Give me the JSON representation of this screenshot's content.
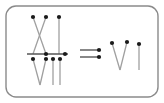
{
  "figure": {
    "kind": "string-diagram-equation",
    "canvas": {
      "width": 164,
      "height": 103,
      "background": "#ffffff"
    },
    "colors": {
      "frame_stroke": "#8a8a8a",
      "edge_stroke": "#a0a0a0",
      "node_fill": "#1a1a1a",
      "bar_stroke": "#555555",
      "arrow_stroke": "#6a6a6a"
    },
    "strokes": {
      "frame_width": 1.4,
      "edge_width": 1.3,
      "bar_width": 1.6,
      "arrow_width": 1.6
    },
    "node_radius": 2.1,
    "frame": {
      "x": 6,
      "y": 6,
      "width": 152,
      "height": 91,
      "rx": 10,
      "ry": 10
    },
    "lhs": {
      "label": "fraction-expression",
      "numerator": {
        "label": "numerator-diagram",
        "nodes": [
          {
            "name": "n1",
            "x": 33,
            "y": 17
          },
          {
            "name": "n2",
            "x": 46,
            "y": 17
          },
          {
            "name": "n3",
            "x": 59,
            "y": 17
          }
        ],
        "edges": [
          {
            "name": "cross-a",
            "x1": 33,
            "y1": 17,
            "x2": 46,
            "y2": 54
          },
          {
            "name": "cross-b",
            "x1": 46,
            "y1": 17,
            "x2": 33,
            "y2": 54
          },
          {
            "name": "straight-c",
            "x1": 59,
            "y1": 17,
            "x2": 59,
            "y2": 54
          }
        ]
      },
      "fraction_bar": {
        "name": "fraction-bar",
        "x1": 27,
        "y1": 54,
        "x2": 68,
        "y2": 54,
        "nodes": [
          {
            "name": "b1",
            "x": 46,
            "y": 54
          },
          {
            "name": "b2",
            "x": 65,
            "y": 54
          }
        ]
      },
      "denominator": {
        "label": "denominator-diagram",
        "nodes": [
          {
            "name": "d1",
            "x": 33,
            "y": 59
          },
          {
            "name": "d2",
            "x": 46,
            "y": 59
          },
          {
            "name": "d3",
            "x": 53,
            "y": 59
          },
          {
            "name": "d4",
            "x": 60,
            "y": 59
          }
        ],
        "edges": [
          {
            "name": "vee-left",
            "x1": 33,
            "y1": 59,
            "x2": 40,
            "y2": 85
          },
          {
            "name": "vee-right",
            "x1": 46,
            "y1": 59,
            "x2": 40,
            "y2": 85
          },
          {
            "name": "straight-d3",
            "x1": 53,
            "y1": 59,
            "x2": 53,
            "y2": 85
          },
          {
            "name": "straight-d4",
            "x1": 60,
            "y1": 59,
            "x2": 60,
            "y2": 85
          }
        ]
      }
    },
    "relation": {
      "name": "implies-double-arrow",
      "symbol": "=>",
      "lines": [
        {
          "name": "arrow-line-top",
          "x1": 80,
          "y1": 50,
          "x2": 99,
          "y2": 50
        },
        {
          "name": "arrow-line-bottom",
          "x1": 80,
          "y1": 57,
          "x2": 99,
          "y2": 57
        }
      ],
      "nodes": [
        {
          "name": "a1",
          "x": 99,
          "y": 50
        },
        {
          "name": "a2",
          "x": 99,
          "y": 57
        }
      ]
    },
    "rhs": {
      "label": "result-diagram",
      "nodes": [
        {
          "name": "r1",
          "x": 112,
          "y": 43
        },
        {
          "name": "r2",
          "x": 127,
          "y": 42
        },
        {
          "name": "r3",
          "x": 139,
          "y": 44
        }
      ],
      "edges": [
        {
          "name": "vee-left",
          "x1": 112,
          "y1": 43,
          "x2": 120,
          "y2": 70
        },
        {
          "name": "vee-right",
          "x1": 127,
          "y1": 42,
          "x2": 120,
          "y2": 70
        },
        {
          "name": "straight-r3",
          "x1": 139,
          "y1": 44,
          "x2": 139,
          "y2": 70
        }
      ]
    }
  }
}
